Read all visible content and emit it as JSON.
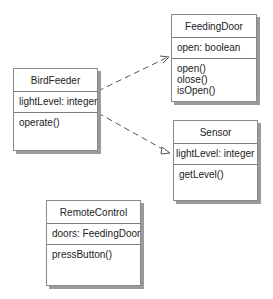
{
  "diagram": {
    "type": "UML class diagram",
    "classes": [
      {
        "id": "feedingdoor",
        "name": "FeedingDoor",
        "attributes": [
          "open: boolean"
        ],
        "operations": [
          "open()",
          "olose()",
          "isOpen()"
        ]
      },
      {
        "id": "birdfeeder",
        "name": "BirdFeeder",
        "attributes": [
          "lightLevel: integer"
        ],
        "operations": [
          "operate()"
        ]
      },
      {
        "id": "sensor",
        "name": "Sensor",
        "attributes": [
          "lightLevel: integer"
        ],
        "operations": [
          "getLevel()"
        ]
      },
      {
        "id": "remotecontrol",
        "name": "RemoteControl",
        "attributes": [
          "doors: FeedingDoor"
        ],
        "operations": [
          "pressButton()"
        ]
      }
    ],
    "relationships": [
      {
        "from": "BirdFeeder",
        "to": "FeedingDoor",
        "style": "dashed",
        "arrow": "open"
      },
      {
        "from": "BirdFeeder",
        "to": "Sensor",
        "style": "dashed",
        "arrow": "open"
      }
    ],
    "colors": {
      "border": "#8a8a8a",
      "shadow": "#9a9a9a",
      "line": "#555555",
      "text": "#222222"
    }
  }
}
